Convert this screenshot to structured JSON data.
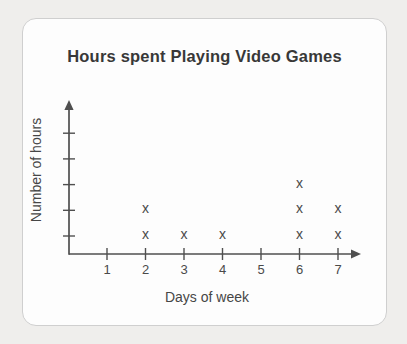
{
  "page": {
    "background_color": "#efeeec"
  },
  "card": {
    "background_color": "#fdfdfd",
    "border_color": "#cfcfcf"
  },
  "chart_data": {
    "type": "line_plot",
    "title": "Hours spent Playing Video Games",
    "xlabel": "Days of week",
    "ylabel": "Number of hours",
    "categories": [
      "1",
      "2",
      "3",
      "4",
      "5",
      "6",
      "7"
    ],
    "values": [
      0,
      2,
      1,
      1,
      0,
      3,
      2
    ],
    "series_note": "values = count of stacked x markers per day",
    "marker_symbol": "x",
    "y_tick_count": 5,
    "x_tick_count": 7,
    "grid": false,
    "legend": "none",
    "axis_color": "#4f4f4f",
    "marker_color": "#4a4a4a",
    "tick_label_color": "#4a4a4a",
    "axis_label_color": "#464646",
    "title_color": "#383838"
  }
}
